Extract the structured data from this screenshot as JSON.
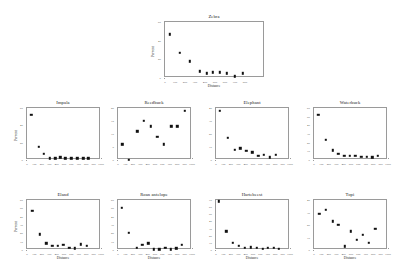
{
  "figure": {
    "background": "#ffffff",
    "marker_color": "#111111",
    "axis_color": "#9a9a9a",
    "layout": "1 centered top panel plus two rows of four panels",
    "shared_xlabel": "Distance",
    "shared_ylabel": "Percent"
  },
  "chart_data": [
    {
      "type": "scatter",
      "title": "Zebra",
      "xlabel": "Distance",
      "ylabel": "Percent",
      "xlim": [
        0,
        1000
      ],
      "ylim": [
        0,
        60
      ],
      "xticks": [
        0,
        100,
        200,
        300,
        400,
        500,
        600,
        700,
        800
      ],
      "yticks": [
        0,
        20,
        40,
        60
      ],
      "grid": false,
      "x": [
        50,
        150,
        250,
        350,
        420,
        480,
        550,
        620,
        700,
        780
      ],
      "y": [
        47,
        27,
        18,
        7,
        5,
        6,
        6,
        5,
        2,
        5
      ]
    },
    {
      "type": "scatter",
      "title": "Impala",
      "xlabel": "Distance",
      "ylabel": "Percent",
      "xlim": [
        0,
        1000
      ],
      "ylim": [
        0,
        60
      ],
      "xticks": [
        0,
        100,
        200,
        300,
        400,
        500,
        600,
        700,
        800,
        900,
        1000
      ],
      "yticks": [
        0,
        20,
        40,
        60
      ],
      "grid": false,
      "x": [
        60,
        160,
        230,
        310,
        380,
        450,
        520,
        600,
        680,
        760,
        830
      ],
      "y": [
        52,
        15,
        7,
        2,
        2,
        3,
        2,
        2,
        2,
        2,
        2
      ]
    },
    {
      "type": "scatter",
      "title": "Reedbuck",
      "xlabel": "Distance",
      "ylabel": "Percent",
      "xlim": [
        0,
        1000
      ],
      "ylim": [
        0,
        20
      ],
      "xticks": [
        0,
        100,
        200,
        300,
        400,
        500,
        600,
        700,
        800,
        900,
        1000
      ],
      "yticks": [
        0,
        5,
        10,
        15,
        20
      ],
      "grid": false,
      "x": [
        60,
        150,
        260,
        350,
        440,
        530,
        620,
        720,
        800,
        900
      ],
      "y": [
        6,
        0,
        11,
        15,
        13,
        9,
        6,
        13,
        13,
        19
      ]
    },
    {
      "type": "scatter",
      "title": "Elephant",
      "xlabel": "Distance",
      "ylabel": "Percent",
      "xlim": [
        0,
        1000
      ],
      "ylim": [
        0,
        40
      ],
      "xticks": [
        0,
        100,
        200,
        300,
        400,
        500,
        600,
        700,
        800,
        900,
        1000
      ],
      "yticks": [
        0,
        10,
        20,
        30,
        40
      ],
      "grid": false,
      "x": [
        50,
        160,
        250,
        330,
        410,
        490,
        570,
        650,
        730,
        810
      ],
      "y": [
        38,
        17,
        8,
        9,
        7,
        6,
        3,
        4,
        2,
        4
      ]
    },
    {
      "type": "scatter",
      "title": "Waterbuck",
      "xlabel": "Distance",
      "ylabel": "Percent",
      "xlim": [
        0,
        1000
      ],
      "ylim": [
        0,
        60
      ],
      "xticks": [
        0,
        100,
        200,
        300,
        400,
        500,
        600,
        700,
        800,
        900,
        1000
      ],
      "yticks": [
        0,
        10,
        20,
        30,
        40,
        50,
        60
      ],
      "grid": false,
      "x": [
        60,
        160,
        250,
        330,
        410,
        480,
        560,
        640,
        710,
        790,
        860
      ],
      "y": [
        52,
        23,
        11,
        7,
        5,
        5,
        5,
        4,
        4,
        3,
        5
      ]
    },
    {
      "type": "scatter",
      "title": "Eland",
      "xlabel": "Distance",
      "ylabel": "Percent",
      "xlim": [
        0,
        1000
      ],
      "ylim": [
        0,
        60
      ],
      "xticks": [
        0,
        100,
        200,
        300,
        400,
        500,
        600,
        700,
        800,
        900,
        1000
      ],
      "yticks": [
        0,
        10,
        20,
        30,
        40,
        50,
        60
      ],
      "grid": false,
      "x": [
        70,
        170,
        260,
        340,
        420,
        490,
        570,
        650,
        730,
        810
      ],
      "y": [
        47,
        19,
        8,
        5,
        5,
        6,
        3,
        2,
        7,
        5
      ]
    },
    {
      "type": "scatter",
      "title": "Roan antelope",
      "xlabel": "Distance",
      "ylabel": "Percent",
      "xlim": [
        0,
        1000
      ],
      "ylim": [
        0,
        60
      ],
      "xticks": [
        0,
        100,
        200,
        300,
        400,
        500,
        600,
        700,
        800,
        900,
        1000
      ],
      "yticks": [
        0,
        10,
        20,
        30,
        40,
        50,
        60
      ],
      "grid": false,
      "x": [
        50,
        150,
        250,
        330,
        410,
        480,
        560,
        640,
        710,
        790,
        860
      ],
      "y": [
        51,
        21,
        3,
        6,
        8,
        1,
        1,
        3,
        1,
        2,
        6
      ]
    },
    {
      "type": "scatter",
      "title": "Hartebeest",
      "xlabel": "Distance",
      "ylabel": "Percent",
      "xlim": [
        0,
        1000
      ],
      "ylim": [
        0,
        70
      ],
      "xticks": [
        0,
        100,
        200,
        300,
        400,
        500,
        600,
        700,
        800,
        900,
        1000
      ],
      "yticks": [
        0,
        10,
        20,
        30,
        40,
        50,
        60,
        70
      ],
      "grid": false,
      "x": [
        40,
        140,
        230,
        310,
        390,
        470,
        550,
        630,
        700,
        780,
        850
      ],
      "y": [
        68,
        26,
        10,
        6,
        3,
        4,
        3,
        2,
        3,
        3,
        2
      ]
    },
    {
      "type": "scatter",
      "title": "Topi",
      "xlabel": "Distance",
      "ylabel": "Percent",
      "xlim": [
        0,
        1000
      ],
      "ylim": [
        0,
        40
      ],
      "xticks": [
        0,
        100,
        200,
        300,
        400,
        500,
        600,
        700,
        800,
        900,
        1000
      ],
      "yticks": [
        0,
        10,
        20,
        30,
        40
      ],
      "grid": false,
      "x": [
        70,
        160,
        250,
        330,
        420,
        500,
        580,
        660,
        740,
        830
      ],
      "y": [
        29,
        32,
        23,
        20,
        3,
        15,
        8,
        12,
        6,
        17
      ]
    }
  ]
}
